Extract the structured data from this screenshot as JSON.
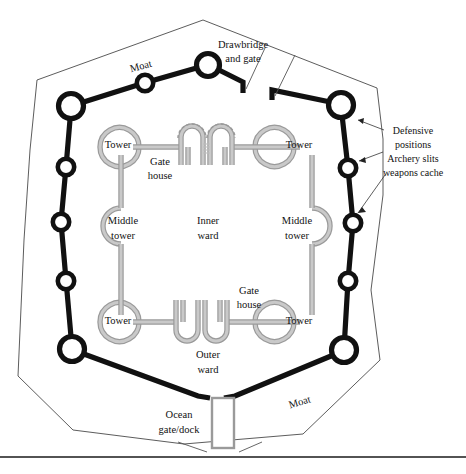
{
  "diagram": {
    "colors": {
      "moat_wall": "#111111",
      "inner_wall": "#9a9a9a",
      "inner_wall_core": "#c9c9c9",
      "outer_boundary": "#4a4a4a",
      "text": "#111111",
      "background": "#ffffff"
    }
  },
  "labels": {
    "moat_top": "Moat",
    "moat_bottom": "Moat",
    "drawbridge_line1": "Drawbridge",
    "drawbridge_line2": "and gate",
    "tower_top_left": "Tower",
    "tower_top_right": "Tower",
    "tower_bottom_left": "Tower",
    "tower_bottom_right": "Tower",
    "middle_tower_left_line1": "Middle",
    "middle_tower_left_line2": "tower",
    "middle_tower_right_line1": "Middle",
    "middle_tower_right_line2": "tower",
    "gate_house_top_line1": "Gate",
    "gate_house_top_line2": "house",
    "gate_house_bottom_line1": "Gate",
    "gate_house_bottom_line2": "house",
    "inner_ward_line1": "Inner",
    "inner_ward_line2": "ward",
    "outer_ward_line1": "Outer",
    "outer_ward_line2": "ward",
    "ocean_gate_line1": "Ocean",
    "ocean_gate_line2": "gate/dock",
    "annotation_line1": "Defensive",
    "annotation_line2": "positions",
    "annotation_line3": "Archery slits",
    "annotation_line4": "weapons cache"
  }
}
